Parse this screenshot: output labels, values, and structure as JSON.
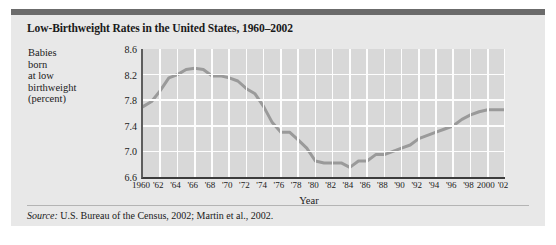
{
  "figure": {
    "title": "Low-Birthweight Rates in the United States, 1960–2002",
    "source_keyword": "Source:",
    "source_text": " U.S. Bureau of the Census, 2002; Martin et al., 2002.",
    "ylabel_lines": [
      "Babies",
      "born",
      "at low",
      "birthweight",
      "(percent)"
    ],
    "colors": {
      "page_background": "#ffffff",
      "figure_background": "#e8e8e8",
      "top_rule": "#6b6b6b",
      "plot_background": "#d8d8d8",
      "gridline": "#fdfdfd",
      "series_line": "#9a9a9a",
      "axis": "#3c3c3c",
      "text": "#1a1a1a"
    }
  },
  "chart_data": {
    "type": "line",
    "title": "Low-Birthweight Rates in the United States, 1960–2002",
    "subtitle": "",
    "xlabel": "Year",
    "ylabel": "Babies born at low birthweight (percent)",
    "grid": true,
    "legend_position": "none",
    "xlim": [
      1960,
      2002
    ],
    "ylim": [
      6.6,
      8.6
    ],
    "yticks": [
      6.6,
      7.0,
      7.4,
      7.8,
      8.2,
      8.6
    ],
    "ytick_labels": [
      "6.6",
      "7.0",
      "7.4",
      "7.8",
      "8.2",
      "8.6"
    ],
    "xticks": [
      1960,
      1962,
      1964,
      1966,
      1968,
      1970,
      1972,
      1974,
      1976,
      1978,
      1980,
      1982,
      1984,
      1986,
      1988,
      1990,
      1992,
      1994,
      1996,
      1998,
      2000,
      2002
    ],
    "xtick_labels": [
      "1960",
      "'62",
      "'64",
      "'66",
      "'68",
      "'70",
      "'72",
      "'74",
      "'76",
      "'78",
      "'80",
      "'82",
      "'84",
      "'86",
      "'88",
      "'90",
      "'92",
      "'94",
      "'96",
      "'98",
      "2000",
      "'02"
    ],
    "series": [
      {
        "name": "Low-birthweight rate",
        "color": "#9a9a9a",
        "x": [
          1960,
          1961,
          1962,
          1963,
          1964,
          1965,
          1966,
          1967,
          1968,
          1969,
          1970,
          1971,
          1972,
          1973,
          1974,
          1975,
          1976,
          1977,
          1978,
          1979,
          1980,
          1981,
          1982,
          1983,
          1984,
          1985,
          1986,
          1987,
          1988,
          1989,
          1990,
          1991,
          1992,
          1993,
          1994,
          1995,
          1996,
          1997,
          1998,
          1999,
          2000,
          2001,
          2002
        ],
        "values": [
          7.7,
          7.78,
          7.95,
          8.15,
          8.2,
          8.28,
          8.3,
          8.28,
          8.18,
          8.18,
          8.15,
          8.1,
          7.98,
          7.9,
          7.7,
          7.45,
          7.3,
          7.3,
          7.18,
          7.05,
          6.85,
          6.82,
          6.82,
          6.82,
          6.75,
          6.85,
          6.85,
          6.95,
          6.95,
          7.0,
          7.05,
          7.1,
          7.2,
          7.25,
          7.3,
          7.35,
          7.4,
          7.5,
          7.57,
          7.62,
          7.65,
          7.65,
          7.65
        ]
      }
    ],
    "annotations": []
  }
}
